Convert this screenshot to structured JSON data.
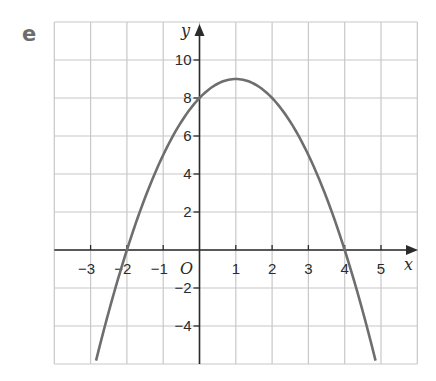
{
  "part_label": "e",
  "chart_data": {
    "type": "line",
    "title": "",
    "xlabel": "x",
    "ylabel": "y",
    "origin_label": "O",
    "xlim": [
      -4,
      6
    ],
    "ylim": [
      -6,
      12
    ],
    "x_ticks": [
      -3,
      -2,
      -1,
      1,
      2,
      3,
      4,
      5
    ],
    "x_tick_labels": [
      "−3",
      "−2",
      "−1",
      "1",
      "2",
      "3",
      "4",
      "5"
    ],
    "y_ticks": [
      10,
      8,
      6,
      4,
      2,
      -2,
      -4
    ],
    "y_tick_labels": [
      "10",
      "8",
      "6",
      "4",
      "2",
      "−2",
      "−4"
    ],
    "grid": true,
    "grid_x_step": 1,
    "grid_y_step": 2,
    "legend": null,
    "series": [
      {
        "name": "y = -x^2 + 2x + 8",
        "equation": "y = -(x - 1)^2 + 9",
        "x": [
          -3,
          -2,
          -1,
          0,
          1,
          2,
          3,
          4,
          5
        ],
        "y": [
          -7,
          0,
          5,
          8,
          9,
          8,
          5,
          0,
          -7
        ],
        "vertex": [
          1,
          9
        ],
        "roots": [
          -2,
          4
        ],
        "y_intercept": 8
      }
    ],
    "colors": {
      "curve": "#6e6e6e",
      "grid": "#c8c8c8",
      "axes": "#2b2b2b"
    }
  }
}
